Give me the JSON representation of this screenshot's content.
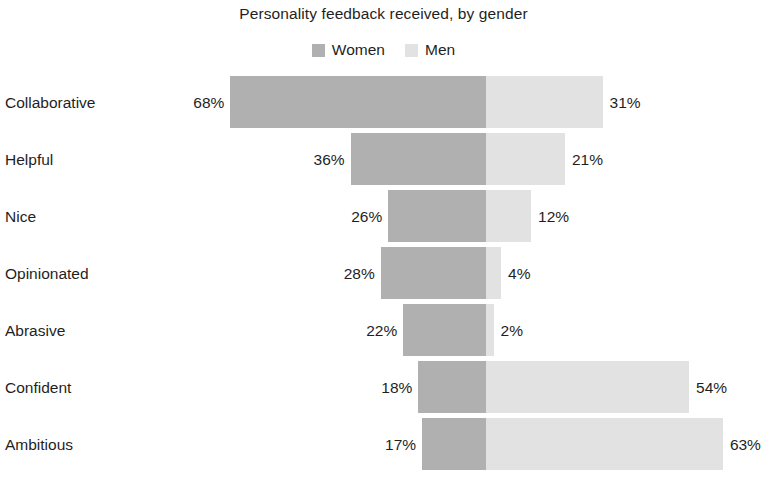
{
  "chart_data": {
    "type": "bar",
    "subtype": "diverging-stacked-bar",
    "title": "Personality feedback received, by gender",
    "subtitle": "",
    "xlabel": "",
    "ylabel": "",
    "grid": false,
    "legend_position": "top-center",
    "value_suffix": "%",
    "axis_center_label": "",
    "categories": [
      "Collaborative",
      "Helpful",
      "Nice",
      "Opinionated",
      "Abrasive",
      "Confident",
      "Ambitious"
    ],
    "series": [
      {
        "name": "Women",
        "color": "#b0b0b0",
        "direction": "left",
        "values": [
          68,
          36,
          26,
          28,
          22,
          18,
          17
        ],
        "value_labels": [
          "68%",
          "36%",
          "26%",
          "28%",
          "22%",
          "18%",
          "17%"
        ]
      },
      {
        "name": "Men",
        "color": "#e2e2e2",
        "direction": "right",
        "values": [
          31,
          21,
          12,
          4,
          2,
          54,
          63
        ],
        "value_labels": [
          "31%",
          "21%",
          "12%",
          "4%",
          "2%",
          "54%",
          "63%"
        ]
      }
    ],
    "xlim": [
      -68,
      63
    ]
  },
  "legend": {
    "items": [
      {
        "label": "Women",
        "color": "#b0b0b0",
        "swatch_name": "legend-swatch-women"
      },
      {
        "label": "Men",
        "color": "#e2e2e2",
        "swatch_name": "legend-swatch-men"
      }
    ]
  },
  "colors": {
    "background": "#ffffff",
    "text": "#1f1f1f",
    "women": "#b0b0b0",
    "men": "#e2e2e2"
  },
  "layout": {
    "center_x": 486,
    "px_per_percent": 3.76,
    "bar_height": 52,
    "row_pitch": 57,
    "first_row_top": 76
  }
}
